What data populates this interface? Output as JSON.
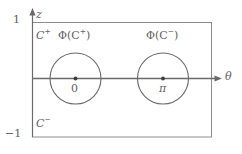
{
  "figure": {
    "background_color": "#ffffff",
    "line_color": "#6a6a6a",
    "text_color": "#5f5f5f"
  },
  "axes": {
    "vertical": {
      "name": "z-axis",
      "label": "z",
      "arrow": "up",
      "ticks": [
        {
          "label": "1",
          "position": "top"
        },
        {
          "label": "−1",
          "position": "bottom"
        }
      ]
    },
    "horizontal": {
      "name": "theta-axis",
      "label": "θ",
      "arrow": "right"
    }
  },
  "regions": {
    "upper": {
      "base": "C",
      "sign": "+"
    },
    "lower": {
      "base": "C",
      "sign": "−"
    }
  },
  "circles": [
    {
      "name": "circle-around-zero",
      "center_label": "0",
      "map_label_base": "Φ(C",
      "map_label_sign": "+",
      "map_label_close": ")",
      "cx": 75.5,
      "cy": 78.5,
      "r": 25.5
    },
    {
      "name": "circle-around-pi",
      "center_label": "π",
      "map_label_base": "Φ(C",
      "map_label_sign": "−",
      "map_label_close": ")",
      "cx": 163,
      "cy": 78.5,
      "r": 25.5
    }
  ],
  "box": {
    "left": 32,
    "top": 22,
    "right": 212,
    "bottom": 137
  }
}
